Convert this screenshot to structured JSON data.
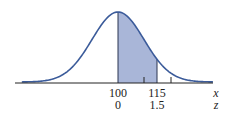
{
  "chart_data": {
    "type": "area",
    "title": "",
    "distribution": {
      "mean": 100,
      "sd": 10
    },
    "shaded_region": {
      "from_x": 100,
      "to_x": 115,
      "from_z": 0,
      "to_z": 1.5
    },
    "x_axis": {
      "label": "x",
      "tick_labels": [
        "100",
        "115"
      ],
      "tick_values": [
        100,
        115
      ],
      "minor_ticks": [
        110,
        120
      ]
    },
    "z_axis": {
      "label": "z",
      "tick_labels": [
        "0",
        "1.5"
      ],
      "tick_values": [
        0,
        1.5
      ]
    },
    "colors": {
      "curve": "#3b5b9a",
      "shade": "#a9b6d8",
      "axis": "#222222"
    },
    "grid": false,
    "legend": null
  },
  "labels": {
    "x_tick_1": "100",
    "x_tick_2": "115",
    "z_tick_1": "0",
    "z_tick_2": "1.5",
    "x_axis_label": "x",
    "z_axis_label": "z"
  }
}
